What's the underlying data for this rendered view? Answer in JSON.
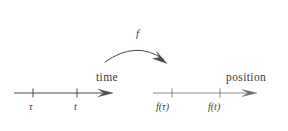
{
  "figure": {
    "background_color": "#ffffff",
    "ink_color": "#3b3b3b"
  },
  "mapping_arrow": {
    "label": "f",
    "name": "function-arrow",
    "from": [
      105,
      62
    ],
    "apex": [
      136,
      46
    ],
    "to": [
      166,
      63
    ]
  },
  "axes": [
    {
      "id": "time-axis",
      "name": "time",
      "label": "time",
      "label_position": [
        96,
        72
      ],
      "line_start": [
        14,
        93
      ],
      "line_end": [
        113,
        93
      ],
      "arrowhead": true,
      "ticks": [
        {
          "id": "tau",
          "label": "τ",
          "x": 33,
          "label_position": [
            29,
            102
          ]
        },
        {
          "id": "t",
          "label": "t",
          "x": 77,
          "label_position": [
            74,
            102
          ]
        }
      ]
    },
    {
      "id": "position-axis",
      "name": "position",
      "label": "position",
      "label_position": [
        226,
        72
      ],
      "line_start": [
        153,
        93
      ],
      "line_end": [
        257,
        93
      ],
      "arrowhead": true,
      "ticks": [
        {
          "id": "f-tau",
          "label": "f(τ)",
          "x": 172,
          "label_position": [
            156,
            102
          ]
        },
        {
          "id": "f-t",
          "label": "f(t)",
          "x": 220,
          "label_position": [
            208,
            102
          ]
        }
      ]
    }
  ]
}
